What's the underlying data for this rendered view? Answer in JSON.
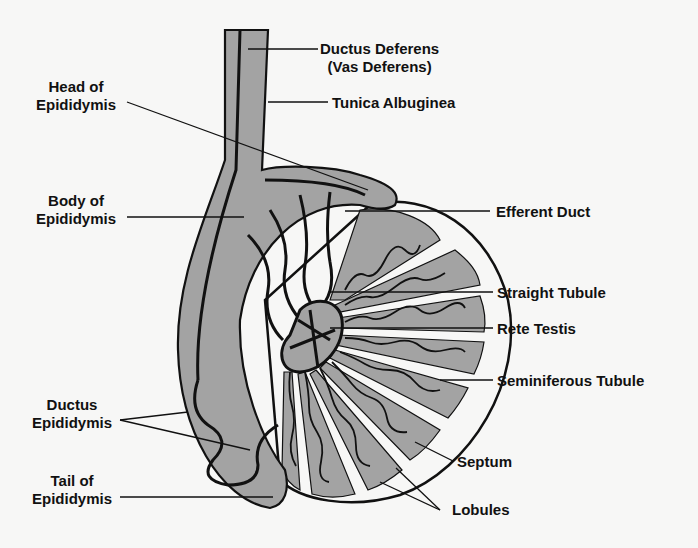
{
  "diagram": {
    "colors": {
      "background": "#f7f7f6",
      "tissue": "#a3a3a3",
      "outline": "#111111",
      "gap": "#ffffff"
    },
    "labels": {
      "ductus_deferens": {
        "line1": "Ductus Deferens",
        "line2": "(Vas Deferens)"
      },
      "tunica_albuginea": "Tunica Albuginea",
      "head_of_epididymis": {
        "line1": "Head of",
        "line2": "Epididymis"
      },
      "body_of_epididymis": {
        "line1": "Body of",
        "line2": "Epididymis"
      },
      "efferent_duct": "Efferent Duct",
      "straight_tubule": "Straight Tubule",
      "rete_testis": "Rete Testis",
      "seminiferous_tubule": "Seminiferous Tubule",
      "ductus_epididymis": {
        "line1": "Ductus",
        "line2": "Epididymis"
      },
      "septum": "Septum",
      "tail_of_epididymis": {
        "line1": "Tail of",
        "line2": "Epididymis"
      },
      "lobules": "Lobules"
    }
  }
}
